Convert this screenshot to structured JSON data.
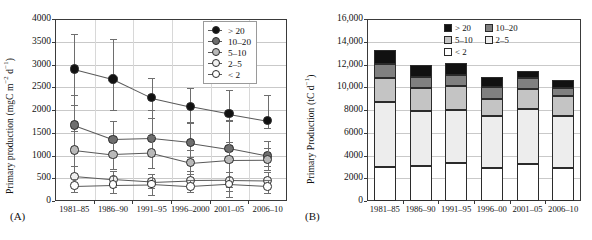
{
  "figure": {
    "panelA_label": "(A)",
    "panelB_label": "(B)"
  },
  "panelA": {
    "ylabel_main": "Primary production (mgC m",
    "ylabel_sup1": "−2",
    "ylabel_mid": " d",
    "ylabel_sup2": "−1",
    "ylabel_end": ")",
    "yticks": [
      "4000",
      "3500",
      "3000",
      "2500",
      "2000",
      "1500",
      "1000",
      "500",
      "0"
    ],
    "xticks": [
      "1981–85",
      "1986–90",
      "1991–95",
      "1996–2000",
      "2001–05",
      "2006–10"
    ],
    "legend": [
      {
        "label": "> 20",
        "fill": "#111111"
      },
      {
        "label": "10–20",
        "fill": "#6e6e6e"
      },
      {
        "label": "5–10",
        "fill": "#b9b9b9"
      },
      {
        "label": "2–5",
        "fill": "#f0f0f0"
      },
      {
        "label": "< 2",
        "fill": "#ffffff"
      }
    ]
  },
  "panelB": {
    "ylabel_main": "Primary Production (tC d",
    "ylabel_sup": "−1",
    "ylabel_end": ")",
    "yticks": [
      "16,000",
      "14,000",
      "12,000",
      "10,000",
      "8000",
      "6000",
      "4000",
      "2000",
      "0"
    ],
    "xticks": [
      "1981–85",
      "1986–90",
      "1991–95",
      "1996–00",
      "2001–05",
      "2006–10"
    ],
    "legend": [
      {
        "label": "> 20",
        "fill": "#111111"
      },
      {
        "label": "10–20",
        "fill": "#808080"
      },
      {
        "label": "5–10",
        "fill": "#c4c4c4"
      },
      {
        "label": "2–5",
        "fill": "#ededed"
      },
      {
        "label": "< 2",
        "fill": "#ffffff"
      }
    ]
  },
  "chart_data": [
    {
      "type": "line",
      "panel": "A",
      "title": "",
      "xlabel": "",
      "ylabel": "Primary production (mgC m−2 d−1)",
      "ylim": [
        0,
        4000
      ],
      "ytick_step": 500,
      "grid": true,
      "legend_position": "top-right",
      "categories": [
        "1981–85",
        "1986–90",
        "1991–95",
        "1996–2000",
        "2001–05",
        "2006–10"
      ],
      "series": [
        {
          "name": "> 20",
          "marker": "filled-black-circle",
          "values": [
            2900,
            2680,
            2270,
            2080,
            1920,
            1770
          ],
          "err_low": [
            2120,
            1990,
            1830,
            1740,
            1750,
            1600
          ],
          "err_high": [
            3680,
            3560,
            2710,
            2480,
            2450,
            2320
          ]
        },
        {
          "name": "10–20",
          "marker": "dark-gray-circle",
          "values": [
            1665,
            1355,
            1375,
            1285,
            1155,
            990
          ],
          "err_low": [
            1190,
            1010,
            1060,
            965,
            880,
            760
          ],
          "err_high": [
            2320,
            1750,
            2000,
            1720,
            1790,
            1320
          ]
        },
        {
          "name": "5–10",
          "marker": "light-gray-circle",
          "values": [
            1125,
            1025,
            1060,
            845,
            910,
            915
          ],
          "err_low": [
            760,
            700,
            720,
            600,
            95,
            690
          ],
          "err_high": [
            1540,
            1380,
            1430,
            1130,
            1290,
            1160
          ]
        },
        {
          "name": "2–5",
          "marker": "near-white-circle",
          "values": [
            545,
            475,
            420,
            455,
            460,
            450
          ],
          "err_low": [
            330,
            300,
            275,
            300,
            305,
            295
          ],
          "err_high": [
            775,
            665,
            600,
            650,
            640,
            630
          ]
        },
        {
          "name": "< 2",
          "marker": "open-white-circle",
          "values": [
            340,
            360,
            370,
            320,
            370,
            325
          ],
          "err_low": [
            205,
            185,
            140,
            195,
            220,
            180
          ],
          "err_high": [
            480,
            545,
            600,
            455,
            520,
            470
          ]
        }
      ]
    },
    {
      "type": "bar",
      "panel": "B",
      "stacked": true,
      "title": "",
      "xlabel": "",
      "ylabel": "Primary Production (tC d−1)",
      "ylim": [
        0,
        16000
      ],
      "ytick_step": 2000,
      "grid": true,
      "legend_position": "top-right",
      "categories": [
        "1981–85",
        "1986–90",
        "1991–95",
        "1996–00",
        "2001–05",
        "2006–10"
      ],
      "series": [
        {
          "name": "< 2",
          "values": [
            3000,
            3080,
            3320,
            2900,
            3220,
            2900
          ]
        },
        {
          "name": "2–5",
          "values": [
            5700,
            4800,
            4680,
            4540,
            4860,
            4580
          ]
        },
        {
          "name": "5–10",
          "values": [
            2100,
            2050,
            2100,
            1550,
            1800,
            1760
          ]
        },
        {
          "name": "10–20",
          "values": [
            1250,
            1000,
            1000,
            1000,
            920,
            730
          ]
        },
        {
          "name": "> 20",
          "values": [
            1250,
            1000,
            1000,
            900,
            600,
            680
          ]
        }
      ],
      "totals": [
        13300,
        11930,
        12100,
        10890,
        11400,
        10650
      ]
    }
  ]
}
